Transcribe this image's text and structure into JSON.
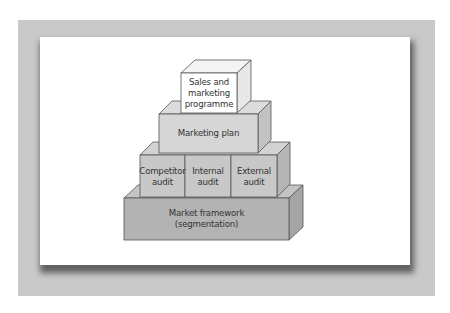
{
  "diagram": {
    "type": "stacked-block-pyramid",
    "colors": {
      "frame": "#c9c9c9",
      "panel": "#ffffff",
      "top_block": "#ffffff",
      "plan_block": "#d6d6d6",
      "audit_blocks": "#c8c8c8",
      "base_block": "#b3b3b3",
      "stroke": "#555555"
    },
    "blocks": {
      "top": {
        "line1": "Sales and",
        "line2": "marketing",
        "line3": "programme"
      },
      "plan": {
        "line1": "Marketing plan"
      },
      "audits": [
        {
          "line1": "Competitor",
          "line2": "audit"
        },
        {
          "line1": "Internal",
          "line2": "audit"
        },
        {
          "line1": "External",
          "line2": "audit"
        }
      ],
      "base": {
        "line1": "Market framework",
        "line2": "(segmentation)"
      }
    }
  }
}
